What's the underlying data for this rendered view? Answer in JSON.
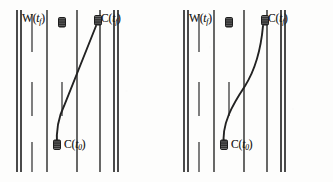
{
  "figure": {
    "type": "diagram",
    "background_color": "#fdfdfc",
    "ink_color": "#262626",
    "width": 333,
    "height": 182,
    "panel_count": 2
  },
  "panels": [
    {
      "id": "left",
      "name": "left-panel",
      "trajectory_style": "near-linear diagonal with lower bend",
      "road": {
        "solid_edges": [
          {
            "name": "left-road-edge-outer",
            "x": 17
          },
          {
            "name": "left-road-edge-inner",
            "x": 21
          },
          {
            "name": "right-road-edge-inner",
            "x": 114
          },
          {
            "name": "right-road-edge-outer",
            "x": 118
          }
        ],
        "lane_dividers": [
          {
            "name": "lane-divider-1",
            "x": 47
          },
          {
            "name": "lane-divider-2",
            "x": 77
          },
          {
            "name": "lane-divider-3",
            "x": 100
          }
        ],
        "dash_segments": [
          {
            "x": 32,
            "y1": 14,
            "y2": 52
          },
          {
            "x": 32,
            "y1": 82,
            "y2": 116
          },
          {
            "x": 32,
            "y1": 142,
            "y2": 172
          },
          {
            "x": 62,
            "y1": 82,
            "y2": 116
          }
        ],
        "road_top": 10,
        "road_bottom": 172
      },
      "vehicles": [
        {
          "name": "vehicle-W-tf",
          "x": 62,
          "y": 22,
          "label_key": "w_tf"
        },
        {
          "name": "vehicle-C-tf",
          "x": 98,
          "y": 20,
          "label_key": "c_tf"
        },
        {
          "name": "vehicle-C-t0",
          "x": 57,
          "y": 144,
          "label_key": "c_t0"
        }
      ],
      "labels": {
        "w_tf": {
          "base": "W",
          "arg_open": "(",
          "var": "t",
          "sub": "f",
          "arg_close": ")"
        },
        "c_tf": {
          "base": "C",
          "arg_open": "(",
          "var": "t",
          "sub": "f",
          "arg_close": ")"
        },
        "c_t0": {
          "base": "C",
          "arg_open": "(",
          "var": "t",
          "sub": "0",
          "arg_close": ")"
        }
      }
    },
    {
      "id": "right",
      "name": "right-panel",
      "trajectory_style": "smooth S-curve",
      "road": {
        "solid_edges": [
          {
            "name": "left-road-edge-outer",
            "x": 17
          },
          {
            "name": "left-road-edge-inner",
            "x": 21
          },
          {
            "name": "right-road-edge-inner",
            "x": 114
          },
          {
            "name": "right-road-edge-outer",
            "x": 118
          }
        ],
        "lane_dividers": [
          {
            "name": "lane-divider-1",
            "x": 47
          },
          {
            "name": "lane-divider-2",
            "x": 77
          },
          {
            "name": "lane-divider-3",
            "x": 100
          }
        ],
        "dash_segments": [
          {
            "x": 32,
            "y1": 14,
            "y2": 52
          },
          {
            "x": 32,
            "y1": 82,
            "y2": 116
          },
          {
            "x": 32,
            "y1": 142,
            "y2": 172
          },
          {
            "x": 62,
            "y1": 82,
            "y2": 116
          }
        ],
        "road_top": 10,
        "road_bottom": 172
      },
      "vehicles": [
        {
          "name": "vehicle-W-tf",
          "x": 62,
          "y": 22,
          "label_key": "w_tf"
        },
        {
          "name": "vehicle-C-tf",
          "x": 98,
          "y": 20,
          "label_key": "c_tf"
        },
        {
          "name": "vehicle-C-t0",
          "x": 57,
          "y": 144,
          "label_key": "c_t0"
        }
      ],
      "labels": {
        "w_tf": {
          "base": "W",
          "arg_open": "(",
          "var": "t",
          "sub": "f",
          "arg_close": ")"
        },
        "c_tf": {
          "base": "C",
          "arg_open": "(",
          "var": "t",
          "sub": "f",
          "arg_close": ")"
        },
        "c_t0": {
          "base": "C",
          "arg_open": "(",
          "var": "t",
          "sub": "0",
          "arg_close": ")"
        }
      }
    }
  ],
  "text": {
    "w_base": "W",
    "c_base": "C",
    "paren_open": "(",
    "paren_close": ")",
    "t_var": "t",
    "sub_f": "f",
    "sub_0": "0"
  }
}
